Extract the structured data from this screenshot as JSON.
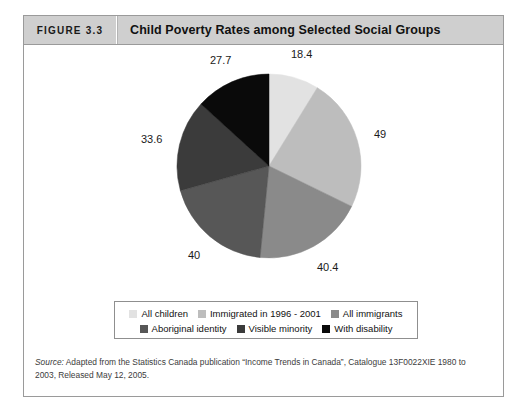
{
  "figure": {
    "number_label": "FIGURE 3.3",
    "title": "Child Poverty Rates among Selected Social Groups"
  },
  "chart_data": {
    "type": "pie",
    "title": "Child Poverty Rates among Selected Social Groups",
    "categories": [
      "All children",
      "Immigrated in 1996 - 2001",
      "All immigrants",
      "Aboriginal identity",
      "Visible minority",
      "With disability"
    ],
    "values": [
      18.4,
      49,
      40.4,
      40,
      33.6,
      27.7
    ],
    "value_labels": [
      "18.4",
      "49",
      "40.4",
      "40",
      "33.6",
      "27.7"
    ],
    "colors": [
      "#e2e2e2",
      "#bdbdbd",
      "#8a8a8a",
      "#575757",
      "#3b3b3b",
      "#0a0a0a"
    ],
    "start_angle_deg": 0,
    "direction": "clockwise",
    "legend_position": "bottom",
    "grid": false,
    "xlabel": "",
    "ylabel": ""
  },
  "legend": {
    "rows": [
      [
        {
          "label": "All children",
          "color": "#e2e2e2"
        },
        {
          "label": "Immigrated in 1996 - 2001",
          "color": "#bdbdbd"
        },
        {
          "label": "All immigrants",
          "color": "#8a8a8a"
        }
      ],
      [
        {
          "label": "Aboriginal identity",
          "color": "#575757"
        },
        {
          "label": "Visible minority",
          "color": "#3b3b3b"
        },
        {
          "label": "With disability",
          "color": "#0a0a0a"
        }
      ]
    ]
  },
  "source": {
    "label": "Source:",
    "text": " Adapted from the Statistics Canada publication “Income Trends in Canada”, Catalogue 13F0022XIE 1980 to 2003, Released May 12, 2005."
  }
}
